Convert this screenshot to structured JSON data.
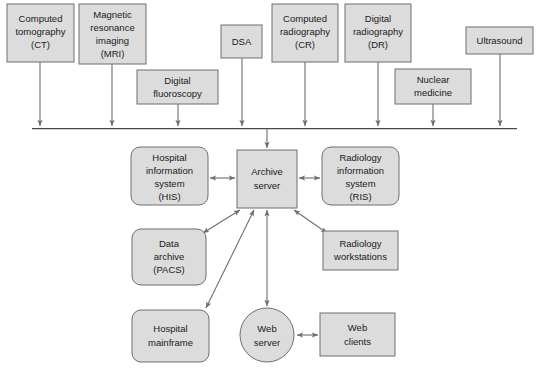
{
  "diagram": {
    "colors": {
      "node_fill": "#dcdcdc",
      "node_stroke": "#6e6e6e",
      "edge": "#6e6e6e",
      "bus": "#4a4a4a",
      "text": "#1a1a1a",
      "background": "#ffffff"
    },
    "modalities": [
      {
        "id": "ct",
        "lines": [
          "Computed",
          "tomography",
          "(CT)"
        ],
        "shape": "rect",
        "x": 7,
        "y": 4,
        "w": 67,
        "h": 58
      },
      {
        "id": "mri",
        "lines": [
          "Magnetic",
          "resonance",
          "imaging",
          "(MRI)"
        ],
        "shape": "rect",
        "x": 79,
        "y": 4,
        "w": 67,
        "h": 60
      },
      {
        "id": "digital-fluoroscopy",
        "lines": [
          "Digital",
          "fluoroscopy"
        ],
        "shape": "rect",
        "x": 137,
        "y": 70,
        "w": 81,
        "h": 34
      },
      {
        "id": "dsa",
        "lines": [
          "DSA"
        ],
        "shape": "rect",
        "x": 221,
        "y": 25,
        "w": 41,
        "h": 33
      },
      {
        "id": "cr",
        "lines": [
          "Computed",
          "radiography",
          "(CR)"
        ],
        "shape": "rect",
        "x": 272,
        "y": 4,
        "w": 66,
        "h": 58
      },
      {
        "id": "dr",
        "lines": [
          "Digital",
          "radiography",
          "(DR)"
        ],
        "shape": "rect",
        "x": 345,
        "y": 4,
        "w": 66,
        "h": 58
      },
      {
        "id": "nuclear-medicine",
        "lines": [
          "Nuclear",
          "medicine"
        ],
        "shape": "rect",
        "x": 395,
        "y": 69,
        "w": 76,
        "h": 35
      },
      {
        "id": "ultrasound",
        "lines": [
          "Ultrasound"
        ],
        "shape": "rect",
        "x": 466,
        "y": 27,
        "w": 67,
        "h": 27
      }
    ],
    "systems": [
      {
        "id": "his",
        "lines": [
          "Hospital",
          "information",
          "system",
          "(HIS)"
        ],
        "shape": "rounded-rect",
        "x": 131,
        "y": 147,
        "w": 77,
        "h": 58
      },
      {
        "id": "archive-server",
        "lines": [
          "Archive",
          "server"
        ],
        "shape": "rect",
        "x": 237,
        "y": 150,
        "w": 60,
        "h": 58
      },
      {
        "id": "ris",
        "lines": [
          "Radiology",
          "information",
          "system",
          "(RIS)"
        ],
        "shape": "rounded-rect",
        "x": 322,
        "y": 147,
        "w": 77,
        "h": 58
      },
      {
        "id": "data-archive-pacs",
        "lines": [
          "Data",
          "archive",
          "(PACS)"
        ],
        "shape": "rounded-rect",
        "x": 132,
        "y": 229,
        "w": 74,
        "h": 56
      },
      {
        "id": "radiology-workstations",
        "lines": [
          "Radiology",
          "workstations"
        ],
        "shape": "rect",
        "x": 323,
        "y": 231,
        "w": 75,
        "h": 39
      },
      {
        "id": "hospital-mainframe",
        "lines": [
          "Hospital",
          "mainframe"
        ],
        "shape": "rounded-rect",
        "x": 132,
        "y": 310,
        "w": 77,
        "h": 52
      },
      {
        "id": "web-server",
        "lines": [
          "Web",
          "server"
        ],
        "shape": "circle",
        "cx": 267,
        "cy": 335,
        "r": 27
      },
      {
        "id": "web-clients",
        "lines": [
          "Web",
          "clients"
        ],
        "shape": "rect",
        "x": 320,
        "y": 313,
        "w": 75,
        "h": 43
      }
    ],
    "bus": {
      "id": "modality-bus",
      "x1": 32,
      "x2": 517,
      "y": 128
    },
    "bus_feeds": [
      {
        "from": "ct",
        "x": 40,
        "y1": 62,
        "y2": 126
      },
      {
        "from": "mri",
        "x": 112,
        "y1": 64,
        "y2": 126
      },
      {
        "from": "digital-fluoroscopy",
        "x": 178,
        "y1": 104,
        "y2": 126
      },
      {
        "from": "dsa",
        "x": 242,
        "y1": 58,
        "y2": 126
      },
      {
        "from": "cr",
        "x": 305,
        "y1": 62,
        "y2": 126
      },
      {
        "from": "dr",
        "x": 378,
        "y1": 62,
        "y2": 126
      },
      {
        "from": "nuclear-medicine",
        "x": 433,
        "y1": 104,
        "y2": 126
      },
      {
        "from": "ultrasound",
        "x": 500,
        "y1": 54,
        "y2": 126
      }
    ],
    "edges": [
      {
        "id": "bus-to-archive-server",
        "kind": "arrow-down",
        "arrows": "single"
      },
      {
        "id": "his-archive-server",
        "kind": "horizontal",
        "arrows": "double"
      },
      {
        "id": "archive-server-ris",
        "kind": "horizontal",
        "arrows": "double"
      },
      {
        "id": "archive-server-data-archive",
        "kind": "diagonal",
        "arrows": "double"
      },
      {
        "id": "archive-server-radiology-workstations",
        "kind": "diagonal",
        "arrows": "double"
      },
      {
        "id": "archive-server-hospital-mainframe",
        "kind": "diagonal",
        "arrows": "double"
      },
      {
        "id": "archive-server-web-server",
        "kind": "vertical",
        "arrows": "double"
      },
      {
        "id": "web-server-web-clients",
        "kind": "horizontal",
        "arrows": "double"
      }
    ]
  }
}
